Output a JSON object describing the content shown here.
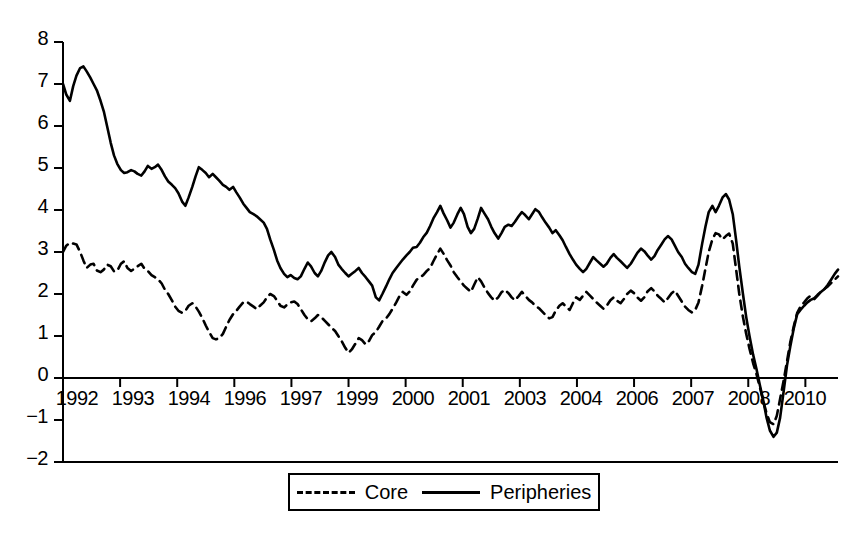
{
  "chart_data": {
    "type": "line",
    "title": "",
    "subtitle": "",
    "xlabel": "",
    "ylabel": "",
    "ylim": [
      -2,
      8
    ],
    "xlim": [
      1992.0,
      2011.0
    ],
    "grid": false,
    "legend_position": "bottom",
    "y_ticks": [
      8,
      7,
      6,
      5,
      4,
      3,
      2,
      1,
      0,
      -1,
      -2
    ],
    "y_tick_labels": [
      "8",
      "7",
      "6",
      "5",
      "4",
      "3",
      "2",
      "1",
      "0",
      "−1",
      "−2"
    ],
    "x_tick_labels": [
      "1992",
      "1993",
      "1994",
      "1996",
      "1997",
      "1999",
      "2000",
      "2001",
      "2003",
      "2004",
      "2006",
      "2007",
      "2008",
      "2010"
    ],
    "x_tick_values": [
      1992.0,
      1993.4,
      1994.8,
      1996.2,
      1997.6,
      1999.0,
      2000.4,
      2001.8,
      2003.2,
      2004.6,
      2006.0,
      2007.4,
      2008.8,
      2010.2
    ],
    "zero_line": true,
    "colors": {
      "core": "#000000",
      "peripheries": "#000000"
    },
    "series": [
      {
        "name": "Core",
        "style": "dashed",
        "x": [
          1992.0,
          1992.08,
          1992.17,
          1992.25,
          1992.33,
          1992.42,
          1992.5,
          1992.58,
          1992.67,
          1992.75,
          1992.83,
          1992.92,
          1993.0,
          1993.08,
          1993.17,
          1993.25,
          1993.33,
          1993.42,
          1993.5,
          1993.58,
          1993.67,
          1993.75,
          1993.83,
          1993.92,
          1994.0,
          1994.08,
          1994.17,
          1994.25,
          1994.33,
          1994.42,
          1994.5,
          1994.58,
          1994.67,
          1994.75,
          1994.83,
          1994.92,
          1995.0,
          1995.08,
          1995.17,
          1995.25,
          1995.33,
          1995.42,
          1995.5,
          1995.58,
          1995.67,
          1995.75,
          1995.83,
          1995.92,
          1996.0,
          1996.08,
          1996.17,
          1996.25,
          1996.33,
          1996.42,
          1996.5,
          1996.58,
          1996.67,
          1996.75,
          1996.83,
          1996.92,
          1997.0,
          1997.08,
          1997.17,
          1997.25,
          1997.33,
          1997.42,
          1997.5,
          1997.58,
          1997.67,
          1997.75,
          1997.83,
          1997.92,
          1998.0,
          1998.08,
          1998.17,
          1998.25,
          1998.33,
          1998.42,
          1998.5,
          1998.58,
          1998.67,
          1998.75,
          1998.83,
          1998.92,
          1999.0,
          1999.08,
          1999.17,
          1999.25,
          1999.33,
          1999.42,
          1999.5,
          1999.58,
          1999.67,
          1999.75,
          1999.83,
          1999.92,
          2000.0,
          2000.08,
          2000.17,
          2000.25,
          2000.33,
          2000.42,
          2000.5,
          2000.58,
          2000.67,
          2000.75,
          2000.83,
          2000.92,
          2001.0,
          2001.08,
          2001.17,
          2001.25,
          2001.33,
          2001.42,
          2001.5,
          2001.58,
          2001.67,
          2001.75,
          2001.83,
          2001.92,
          2002.0,
          2002.08,
          2002.17,
          2002.25,
          2002.33,
          2002.42,
          2002.5,
          2002.58,
          2002.67,
          2002.75,
          2002.83,
          2002.92,
          2003.0,
          2003.08,
          2003.17,
          2003.25,
          2003.33,
          2003.42,
          2003.5,
          2003.58,
          2003.67,
          2003.75,
          2003.83,
          2003.92,
          2004.0,
          2004.08,
          2004.17,
          2004.25,
          2004.33,
          2004.42,
          2004.5,
          2004.58,
          2004.67,
          2004.75,
          2004.83,
          2004.92,
          2005.0,
          2005.08,
          2005.17,
          2005.25,
          2005.33,
          2005.42,
          2005.5,
          2005.58,
          2005.67,
          2005.75,
          2005.83,
          2005.92,
          2006.0,
          2006.08,
          2006.17,
          2006.25,
          2006.33,
          2006.42,
          2006.5,
          2006.58,
          2006.67,
          2006.75,
          2006.83,
          2006.92,
          2007.0,
          2007.08,
          2007.17,
          2007.25,
          2007.33,
          2007.42,
          2007.5,
          2007.58,
          2007.67,
          2007.75,
          2007.83,
          2007.92,
          2008.0,
          2008.08,
          2008.17,
          2008.25,
          2008.33,
          2008.42,
          2008.5,
          2008.58,
          2008.67,
          2008.75,
          2008.83,
          2008.92,
          2009.0,
          2009.08,
          2009.17,
          2009.25,
          2009.33,
          2009.42,
          2009.5,
          2009.58,
          2009.67,
          2009.75,
          2009.83,
          2009.92,
          2010.0,
          2010.08,
          2010.17,
          2010.25,
          2010.33,
          2010.42,
          2010.5,
          2010.58,
          2010.67,
          2010.75,
          2010.83,
          2010.92,
          2011.0
        ],
        "values": [
          3.0,
          3.15,
          3.22,
          3.2,
          3.18,
          3.0,
          2.8,
          2.62,
          2.7,
          2.72,
          2.56,
          2.52,
          2.58,
          2.7,
          2.66,
          2.54,
          2.55,
          2.72,
          2.78,
          2.62,
          2.55,
          2.6,
          2.66,
          2.72,
          2.6,
          2.55,
          2.45,
          2.4,
          2.35,
          2.25,
          2.1,
          2.0,
          1.85,
          1.7,
          1.6,
          1.55,
          1.6,
          1.72,
          1.78,
          1.7,
          1.58,
          1.42,
          1.25,
          1.1,
          0.95,
          0.92,
          0.95,
          1.05,
          1.22,
          1.38,
          1.52,
          1.6,
          1.7,
          1.8,
          1.82,
          1.76,
          1.7,
          1.64,
          1.72,
          1.8,
          1.92,
          2.0,
          1.95,
          1.84,
          1.72,
          1.68,
          1.75,
          1.8,
          1.82,
          1.76,
          1.64,
          1.5,
          1.4,
          1.35,
          1.42,
          1.5,
          1.45,
          1.36,
          1.28,
          1.2,
          1.12,
          1.0,
          0.88,
          0.72,
          0.6,
          0.68,
          0.82,
          0.95,
          0.9,
          0.8,
          0.88,
          1.02,
          1.1,
          1.22,
          1.35,
          1.42,
          1.52,
          1.65,
          1.8,
          1.95,
          2.05,
          1.98,
          2.06,
          2.2,
          2.34,
          2.4,
          2.45,
          2.55,
          2.62,
          2.78,
          2.95,
          3.08,
          2.96,
          2.8,
          2.68,
          2.52,
          2.4,
          2.3,
          2.2,
          2.12,
          2.05,
          2.22,
          2.4,
          2.3,
          2.16,
          2.02,
          1.92,
          1.84,
          1.92,
          2.04,
          2.1,
          2.02,
          1.92,
          1.85,
          1.95,
          2.05,
          1.96,
          1.86,
          1.8,
          1.72,
          1.66,
          1.58,
          1.5,
          1.42,
          1.45,
          1.6,
          1.72,
          1.78,
          1.7,
          1.62,
          1.78,
          1.92,
          1.86,
          1.96,
          2.05,
          1.96,
          1.88,
          1.8,
          1.72,
          1.65,
          1.72,
          1.85,
          1.92,
          1.84,
          1.78,
          1.88,
          2.0,
          2.08,
          2.02,
          1.92,
          1.84,
          1.92,
          2.06,
          2.14,
          2.06,
          1.96,
          1.88,
          1.8,
          1.9,
          2.02,
          2.08,
          1.96,
          1.82,
          1.7,
          1.62,
          1.56,
          1.62,
          1.8,
          2.2,
          2.6,
          3.0,
          3.3,
          3.45,
          3.42,
          3.3,
          3.38,
          3.44,
          3.2,
          2.6,
          2.0,
          1.45,
          1.05,
          0.7,
          0.35,
          0.1,
          -0.2,
          -0.55,
          -0.85,
          -1.05,
          -1.1,
          -0.9,
          -0.5,
          -0.05,
          0.4,
          0.85,
          1.25,
          1.55,
          1.7,
          1.8,
          1.9,
          1.96,
          1.88,
          1.96,
          2.05,
          2.12,
          2.18,
          2.26,
          2.34,
          2.42
        ]
      },
      {
        "name": "Peripheries",
        "style": "solid",
        "x": [
          1992.0,
          1992.08,
          1992.17,
          1992.25,
          1992.33,
          1992.42,
          1992.5,
          1992.58,
          1992.67,
          1992.75,
          1992.83,
          1992.92,
          1993.0,
          1993.08,
          1993.17,
          1993.25,
          1993.33,
          1993.42,
          1993.5,
          1993.58,
          1993.67,
          1993.75,
          1993.83,
          1993.92,
          1994.0,
          1994.08,
          1994.17,
          1994.25,
          1994.33,
          1994.42,
          1994.5,
          1994.58,
          1994.67,
          1994.75,
          1994.83,
          1994.92,
          1995.0,
          1995.08,
          1995.17,
          1995.25,
          1995.33,
          1995.42,
          1995.5,
          1995.58,
          1995.67,
          1995.75,
          1995.83,
          1995.92,
          1996.0,
          1996.08,
          1996.17,
          1996.25,
          1996.33,
          1996.42,
          1996.5,
          1996.58,
          1996.67,
          1996.75,
          1996.83,
          1996.92,
          1997.0,
          1997.08,
          1997.17,
          1997.25,
          1997.33,
          1997.42,
          1997.5,
          1997.58,
          1997.67,
          1997.75,
          1997.83,
          1997.92,
          1998.0,
          1998.08,
          1998.17,
          1998.25,
          1998.33,
          1998.42,
          1998.5,
          1998.58,
          1998.67,
          1998.75,
          1998.83,
          1998.92,
          1999.0,
          1999.08,
          1999.17,
          1999.25,
          1999.33,
          1999.42,
          1999.5,
          1999.58,
          1999.67,
          1999.75,
          1999.83,
          1999.92,
          2000.0,
          2000.08,
          2000.17,
          2000.25,
          2000.33,
          2000.42,
          2000.5,
          2000.58,
          2000.67,
          2000.75,
          2000.83,
          2000.92,
          2001.0,
          2001.08,
          2001.17,
          2001.25,
          2001.33,
          2001.42,
          2001.5,
          2001.58,
          2001.67,
          2001.75,
          2001.83,
          2001.92,
          2002.0,
          2002.08,
          2002.17,
          2002.25,
          2002.33,
          2002.42,
          2002.5,
          2002.58,
          2002.67,
          2002.75,
          2002.83,
          2002.92,
          2003.0,
          2003.08,
          2003.17,
          2003.25,
          2003.33,
          2003.42,
          2003.5,
          2003.58,
          2003.67,
          2003.75,
          2003.83,
          2003.92,
          2004.0,
          2004.08,
          2004.17,
          2004.25,
          2004.33,
          2004.42,
          2004.5,
          2004.58,
          2004.67,
          2004.75,
          2004.83,
          2004.92,
          2005.0,
          2005.08,
          2005.17,
          2005.25,
          2005.33,
          2005.42,
          2005.5,
          2005.58,
          2005.67,
          2005.75,
          2005.83,
          2005.92,
          2006.0,
          2006.08,
          2006.17,
          2006.25,
          2006.33,
          2006.42,
          2006.5,
          2006.58,
          2006.67,
          2006.75,
          2006.83,
          2006.92,
          2007.0,
          2007.08,
          2007.17,
          2007.25,
          2007.33,
          2007.42,
          2007.5,
          2007.58,
          2007.67,
          2007.75,
          2007.83,
          2007.92,
          2008.0,
          2008.08,
          2008.17,
          2008.25,
          2008.33,
          2008.42,
          2008.5,
          2008.58,
          2008.67,
          2008.75,
          2008.83,
          2008.92,
          2009.0,
          2009.08,
          2009.17,
          2009.25,
          2009.33,
          2009.42,
          2009.5,
          2009.58,
          2009.67,
          2009.75,
          2009.83,
          2009.92,
          2010.0,
          2010.08,
          2010.17,
          2010.25,
          2010.33,
          2010.42,
          2010.5,
          2010.58,
          2010.67,
          2010.75,
          2010.83,
          2010.92,
          2011.0
        ],
        "values": [
          7.0,
          6.75,
          6.6,
          6.95,
          7.2,
          7.38,
          7.42,
          7.3,
          7.15,
          7.0,
          6.85,
          6.6,
          6.35,
          6.0,
          5.6,
          5.3,
          5.1,
          4.95,
          4.88,
          4.9,
          4.95,
          4.92,
          4.86,
          4.82,
          4.92,
          5.05,
          4.98,
          5.02,
          5.08,
          4.95,
          4.8,
          4.68,
          4.6,
          4.52,
          4.4,
          4.2,
          4.1,
          4.3,
          4.55,
          4.8,
          5.02,
          4.95,
          4.88,
          4.78,
          4.86,
          4.78,
          4.7,
          4.6,
          4.55,
          4.48,
          4.55,
          4.42,
          4.3,
          4.15,
          4.05,
          3.95,
          3.9,
          3.85,
          3.78,
          3.7,
          3.55,
          3.3,
          3.05,
          2.8,
          2.62,
          2.48,
          2.4,
          2.45,
          2.38,
          2.35,
          2.42,
          2.6,
          2.75,
          2.66,
          2.5,
          2.42,
          2.55,
          2.76,
          2.92,
          3.0,
          2.88,
          2.7,
          2.6,
          2.5,
          2.42,
          2.48,
          2.55,
          2.62,
          2.5,
          2.4,
          2.3,
          2.2,
          1.92,
          1.85,
          2.0,
          2.18,
          2.35,
          2.5,
          2.62,
          2.72,
          2.82,
          2.92,
          3.0,
          3.1,
          3.12,
          3.22,
          3.35,
          3.46,
          3.62,
          3.8,
          3.95,
          4.1,
          3.92,
          3.75,
          3.58,
          3.7,
          3.9,
          4.05,
          3.9,
          3.6,
          3.45,
          3.55,
          3.8,
          4.05,
          3.92,
          3.78,
          3.6,
          3.45,
          3.32,
          3.45,
          3.6,
          3.65,
          3.62,
          3.72,
          3.85,
          3.95,
          3.88,
          3.78,
          3.9,
          4.02,
          3.95,
          3.82,
          3.7,
          3.58,
          3.45,
          3.52,
          3.4,
          3.28,
          3.12,
          2.95,
          2.82,
          2.7,
          2.6,
          2.52,
          2.6,
          2.75,
          2.88,
          2.8,
          2.72,
          2.65,
          2.72,
          2.86,
          2.95,
          2.86,
          2.78,
          2.7,
          2.62,
          2.72,
          2.85,
          2.98,
          3.08,
          3.02,
          2.92,
          2.82,
          2.9,
          3.05,
          3.18,
          3.3,
          3.38,
          3.3,
          3.15,
          3.0,
          2.88,
          2.72,
          2.62,
          2.52,
          2.48,
          2.7,
          3.2,
          3.6,
          3.95,
          4.1,
          3.95,
          4.1,
          4.3,
          4.38,
          4.25,
          3.9,
          3.3,
          2.65,
          2.0,
          1.45,
          1.0,
          0.55,
          0.22,
          -0.15,
          -0.55,
          -0.95,
          -1.25,
          -1.4,
          -1.3,
          -0.95,
          -0.3,
          0.3,
          0.75,
          1.2,
          1.52,
          1.62,
          1.72,
          1.8,
          1.86,
          1.9,
          1.98,
          2.05,
          2.12,
          2.22,
          2.34,
          2.48,
          2.58
        ]
      }
    ]
  },
  "legend": {
    "core_label": "Core",
    "peripheries_label": "Peripheries"
  },
  "axis": {
    "y_label_8": "8",
    "y_label_7": "7",
    "y_label_6": "6",
    "y_label_5": "5",
    "y_label_4": "4",
    "y_label_3": "3",
    "y_label_2": "2",
    "y_label_1": "1",
    "y_label_0": "0",
    "y_label_m1": "−1",
    "y_label_m2": "−2",
    "x_label_1": "1992",
    "x_label_2": "1993",
    "x_label_3": "1994",
    "x_label_4": "1996",
    "x_label_5": "1997",
    "x_label_6": "1999",
    "x_label_7": "2000",
    "x_label_8": "2001",
    "x_label_9": "2003",
    "x_label_10": "2004",
    "x_label_11": "2006",
    "x_label_12": "2007",
    "x_label_13": "2008",
    "x_label_14": "2010"
  }
}
